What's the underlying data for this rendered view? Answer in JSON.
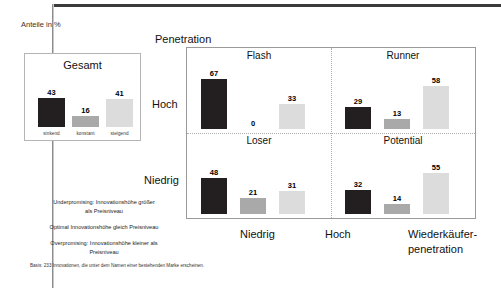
{
  "slide": {
    "y_axis_note": "Anteile in %",
    "matrix_y_title": "Penetration",
    "matrix_y_high": "Hoch",
    "matrix_y_low": "Niedrig",
    "matrix_x_low": "Niedrig",
    "matrix_x_high": "Hoch",
    "matrix_x_title_line1": "Wiederkäufer-",
    "matrix_x_title_line2": "penetration",
    "footnote": "Basis: 233 Innovationen, die unter dem Namen einer bestehenden Marke erscheinen."
  },
  "legend": {
    "lines": [
      "Underpromising: Innovationshöhe größer",
      "als Preisniveau",
      "Optimal Innovationshöhe gleich Preisniveau",
      "Overpromising: Innovationshöhe kleiner als",
      "Preisniveau"
    ],
    "item1_a": "Underpromising: Innovationshöhe größer",
    "item1_b": "als Preisniveau",
    "item2": "Optimal Innovationshöhe gleich Preisniveau",
    "item3_a": "Overpromising: Innovationshöhe kleiner als",
    "item3_b": "Preisniveau"
  },
  "colors": {
    "dark": "#231f20",
    "mid": "#a9a9a9",
    "light": "#dcdcdc",
    "frame": "#3b3b3b",
    "panel_border": "#9a9a9a"
  },
  "chart_data": [
    {
      "type": "bar",
      "title": "Gesamt",
      "categories": [
        "sinkend",
        "konstant",
        "steigend"
      ],
      "values": [
        43,
        16,
        41
      ],
      "ylabel": "Anteile in %",
      "xlabel": "",
      "ylim": [
        0,
        70
      ],
      "series_colors": [
        "#231f20",
        "#a9a9a9",
        "#dcdcdc"
      ]
    },
    {
      "type": "bar",
      "title": "Flash",
      "quadrant": "Hoch / Niedrig",
      "categories": [
        "sinkend",
        "konstant",
        "steigend"
      ],
      "values": [
        67,
        0,
        33
      ],
      "ylim": [
        0,
        70
      ],
      "series_colors": [
        "#231f20",
        "#a9a9a9",
        "#dcdcdc"
      ]
    },
    {
      "type": "bar",
      "title": "Runner",
      "quadrant": "Hoch / Hoch",
      "categories": [
        "sinkend",
        "konstant",
        "steigend"
      ],
      "values": [
        29,
        13,
        58
      ],
      "ylim": [
        0,
        70
      ],
      "series_colors": [
        "#231f20",
        "#a9a9a9",
        "#dcdcdc"
      ]
    },
    {
      "type": "bar",
      "title": "Loser",
      "quadrant": "Niedrig / Niedrig",
      "categories": [
        "sinkend",
        "konstant",
        "steigend"
      ],
      "values": [
        48,
        21,
        31
      ],
      "ylim": [
        0,
        70
      ],
      "series_colors": [
        "#231f20",
        "#a9a9a9",
        "#dcdcdc"
      ]
    },
    {
      "type": "bar",
      "title": "Potential",
      "quadrant": "Niedrig / Hoch",
      "categories": [
        "sinkend",
        "konstant",
        "steigend"
      ],
      "values": [
        32,
        14,
        55
      ],
      "ylim": [
        0,
        70
      ],
      "series_colors": [
        "#231f20",
        "#a9a9a9",
        "#dcdcdc"
      ]
    }
  ]
}
